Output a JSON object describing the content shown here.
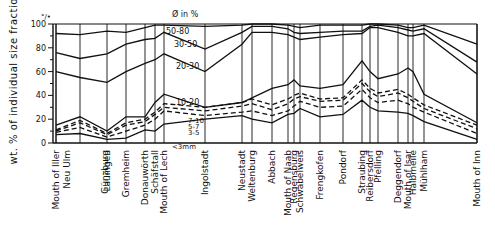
{
  "chart_data": {
    "type": "area",
    "title": "",
    "xlabel": "",
    "ylabel": "wt. % of individual size fractions",
    "y_unit": "%",
    "ylim": [
      0,
      100
    ],
    "yticks": [
      0,
      20,
      40,
      60,
      80,
      100
    ],
    "grid": false,
    "legend_title": "Ø in %",
    "legend_position": "inside, near Mouth of Lech – Ingolstadt",
    "legend_labels": [
      "50-80",
      "30-50",
      "20-30",
      "10-20",
      "7-10",
      "5-7",
      "3-5",
      "<3mm"
    ],
    "note": "Cumulative curves: each line is the cumulative wt.% boundary between grain-size fractions (mm). Dashed lines = 3-5/5-7/7-10 boundaries.",
    "categories": [
      "Mouth of Iller",
      "Neu Ulm",
      "Günzburg",
      "Lauingen",
      "Gremheim",
      "Donauwörth",
      "Schäfstall",
      "Mouth of Lech",
      "Ingolstadt",
      "Neustadt",
      "Weltenburg",
      "Abbach",
      "Mouth of Naab",
      "Regensburg",
      "Schwabelweis",
      "Frengkofen",
      "Pondorf",
      "Straubing",
      "Reibersdorf",
      "Pfelling",
      "Deggendorf",
      "Mouth of Isar",
      "Halbmeile",
      "Mühlham",
      "Mouth of Inn"
    ],
    "x_px": [
      56,
      56,
      80,
      107,
      126,
      145,
      155,
      164,
      205,
      242,
      252,
      272,
      288,
      294,
      300,
      320,
      343,
      362,
      370,
      378,
      398,
      408,
      413,
      424,
      477
    ],
    "series": [
      {
        "name": "<3mm",
        "style": "solid",
        "values": [
          7,
          7,
          8,
          3,
          4,
          11,
          10,
          16,
          20,
          23,
          20,
          17,
          24,
          25,
          29,
          22,
          24,
          36,
          30,
          27,
          26,
          25,
          23,
          18,
          3
        ]
      },
      {
        "name": "3-5",
        "style": "dashed",
        "values": [
          9,
          9,
          13,
          5,
          10,
          15,
          20,
          27,
          23,
          26,
          27,
          23,
          27,
          31,
          35,
          30,
          31,
          45,
          38,
          34,
          36,
          33,
          30,
          26,
          8
        ]
      },
      {
        "name": "5-7",
        "style": "dashed",
        "values": [
          10,
          10,
          17,
          7,
          15,
          18,
          24,
          30,
          27,
          31,
          33,
          28,
          33,
          37,
          39,
          35,
          36,
          50,
          43,
          39,
          42,
          38,
          35,
          29,
          12
        ]
      },
      {
        "name": "7-10",
        "style": "dashed",
        "values": [
          11,
          11,
          19,
          8,
          17,
          20,
          26,
          33,
          30,
          34,
          37,
          32,
          37,
          40,
          42,
          37,
          38,
          53,
          46,
          42,
          45,
          41,
          38,
          32,
          15
        ]
      },
      {
        "name": "10-20",
        "style": "solid",
        "values": [
          15,
          15,
          22,
          10,
          22,
          22,
          34,
          41,
          30,
          34,
          38,
          46,
          49,
          53,
          48,
          46,
          49,
          69,
          60,
          54,
          58,
          63,
          60,
          41,
          17
        ]
      },
      {
        "name": "20-30",
        "style": "solid",
        "values": [
          60,
          60,
          55,
          51,
          60,
          67,
          70,
          75,
          60,
          83,
          93,
          93,
          91,
          89,
          87,
          89,
          91,
          92,
          97,
          97,
          93,
          90,
          90,
          92,
          58
        ]
      },
      {
        "name": "30-50",
        "style": "solid",
        "values": [
          76,
          76,
          71,
          75,
          83,
          87,
          88,
          93,
          79,
          93,
          98,
          98,
          96,
          93,
          92,
          93,
          94,
          94,
          98,
          99,
          97,
          95,
          94,
          96,
          68
        ]
      },
      {
        "name": "50-80",
        "style": "solid",
        "values": [
          92,
          92,
          91,
          94,
          93,
          97,
          99,
          99,
          98,
          99,
          100,
          100,
          99,
          98,
          97,
          99,
          99,
          99,
          100,
          100,
          99,
          97,
          97,
          99,
          83
        ]
      }
    ]
  }
}
